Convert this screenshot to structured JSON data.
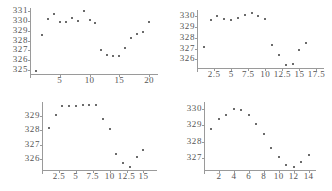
{
  "figure": {
    "layout": "2x2 grid of scatter panels",
    "background_color": "#ffffff",
    "point_color": "#3a3a3a",
    "axis_color": "#9a9a9a",
    "label_color": "#555555"
  },
  "chart_data": [
    {
      "id": "panel-top-left",
      "type": "scatter",
      "title": "",
      "xlabel": "",
      "ylabel": "",
      "grid": false,
      "legend": null,
      "xlim": [
        0,
        21.5
      ],
      "ylim": [
        324.6,
        331.3
      ],
      "xticks": [
        5,
        10,
        15,
        20
      ],
      "xticklabels": [
        "5",
        "10",
        "15",
        "20"
      ],
      "yticks": [
        325,
        326,
        327,
        328,
        329,
        330,
        331
      ],
      "yticklabels": [
        "331",
        "330",
        "329",
        "328",
        "327",
        "326",
        "325"
      ],
      "x": [
        1,
        2,
        3,
        4,
        5,
        6,
        7,
        8,
        9,
        10,
        11,
        12,
        13,
        14,
        15,
        16,
        17,
        18,
        19,
        20
      ],
      "y": [
        324.9,
        328.6,
        330.2,
        330.7,
        329.9,
        329.9,
        330.3,
        330.0,
        331.0,
        330.1,
        329.8,
        327.0,
        326.5,
        326.4,
        326.4,
        327.2,
        328.3,
        328.7,
        328.9,
        329.9
      ]
    },
    {
      "id": "panel-top-right",
      "type": "scatter",
      "title": "",
      "xlabel": "",
      "ylabel": "",
      "grid": false,
      "legend": null,
      "xlim": [
        0,
        18.6
      ],
      "ylim": [
        325.2,
        330.6
      ],
      "xticks": [
        2.5,
        5,
        7.5,
        10,
        12.5,
        15,
        17.5
      ],
      "xticklabels": [
        "2.5",
        "5",
        "7.5",
        "10",
        "12.5",
        "15",
        "17.5"
      ],
      "yticks": [
        326,
        327,
        328,
        329,
        330
      ],
      "yticklabels": [
        "330",
        "329",
        "328",
        "327",
        "326"
      ],
      "x": [
        1,
        2,
        3,
        4,
        5,
        6,
        7,
        8,
        9,
        10,
        11,
        12,
        13,
        14,
        15,
        16
      ],
      "y": [
        327.2,
        329.7,
        330.0,
        329.8,
        329.7,
        329.9,
        330.1,
        330.3,
        330.0,
        329.8,
        327.3,
        326.4,
        325.5,
        325.6,
        326.9,
        327.5
      ]
    },
    {
      "id": "panel-bottom-left",
      "type": "scatter",
      "title": "",
      "xlabel": "",
      "ylabel": "",
      "grid": false,
      "legend": null,
      "xlim": [
        0,
        17.0
      ],
      "ylim": [
        325.2,
        330.0
      ],
      "xticks": [
        2.5,
        5,
        7.5,
        10,
        12.5,
        15
      ],
      "xticklabels": [
        "2.5",
        "5",
        "7.5",
        "10",
        "12.5",
        "15"
      ],
      "yticks": [
        326,
        327,
        328,
        329
      ],
      "yticklabels": [
        "329",
        "328",
        "327",
        "326"
      ],
      "x": [
        1,
        2,
        3,
        4,
        5,
        6,
        7,
        8,
        9,
        10,
        11,
        12,
        13,
        14,
        15
      ],
      "y": [
        328.2,
        329.1,
        329.7,
        329.7,
        329.7,
        329.8,
        329.8,
        329.8,
        328.8,
        328.1,
        326.3,
        325.7,
        325.4,
        326.1,
        326.6
      ]
    },
    {
      "id": "panel-bottom-right",
      "type": "scatter",
      "title": "",
      "xlabel": "",
      "ylabel": "",
      "grid": false,
      "legend": null,
      "xlim": [
        0,
        15.0
      ],
      "ylim": [
        326.3,
        330.4
      ],
      "xticks": [
        2,
        4,
        6,
        8,
        10,
        12,
        14
      ],
      "xticklabels": [
        "2",
        "4",
        "6",
        "8",
        "10",
        "12",
        "14"
      ],
      "yticks": [
        327,
        328,
        329,
        330
      ],
      "yticklabels": [
        "330",
        "329",
        "328",
        "327"
      ],
      "x": [
        1,
        2,
        3,
        4,
        5,
        6,
        7,
        8,
        9,
        10,
        11,
        12,
        13,
        14
      ],
      "y": [
        328.8,
        329.4,
        329.6,
        330.0,
        329.9,
        329.6,
        329.1,
        328.5,
        327.6,
        327.1,
        326.6,
        326.5,
        326.8,
        327.2
      ]
    }
  ]
}
